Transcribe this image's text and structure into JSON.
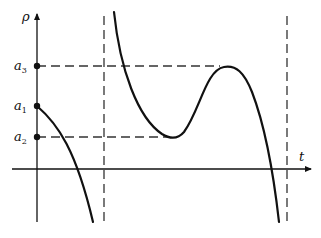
{
  "diagram": {
    "type": "function-graph",
    "axes": {
      "vertical_label": "ρ",
      "horizontal_label": "t"
    },
    "levels": [
      {
        "name": "a3",
        "base": "a",
        "subscript": "3",
        "y_px": 66
      },
      {
        "name": "a1",
        "base": "a",
        "subscript": "1",
        "y_px": 106
      },
      {
        "name": "a2",
        "base": "a",
        "subscript": "2",
        "y_px": 137
      }
    ],
    "asymptotes": [
      {
        "name": "left-vertical-asymptote",
        "x_px": 104
      },
      {
        "name": "right-vertical-asymptote",
        "x_px": 287
      }
    ],
    "curve_features": {
      "start_value": "a1",
      "local_min_value": "a2",
      "local_max_value": "a3"
    },
    "colors": {
      "line": "#111111",
      "dash": "#333333",
      "background": "#ffffff"
    }
  }
}
